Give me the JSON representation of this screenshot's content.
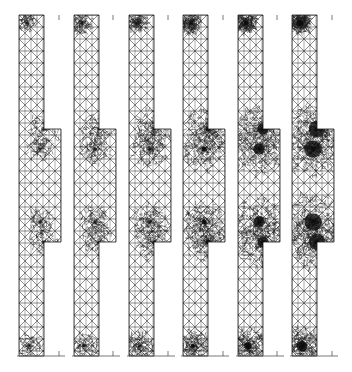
{
  "figure": {
    "panel_count": 6,
    "colors": {
      "background": "#ffffff",
      "mesh_line": "#1a1a1a",
      "dense_fill": "#0a0a0a"
    },
    "geometry": {
      "strip_top": 15,
      "strip_bottom": 356,
      "wide_top": 129,
      "wide_bottom": 242,
      "strip_width": 25,
      "wide_extra": 17,
      "baseline_length": 46
    },
    "panels": [
      {
        "id": 1,
        "x": 19,
        "tick_x": 59,
        "refinement": 0.15
      },
      {
        "id": 2,
        "x": 74,
        "tick_x": 113,
        "refinement": 0.25
      },
      {
        "id": 3,
        "x": 129,
        "tick_x": 168,
        "refinement": 0.4
      },
      {
        "id": 4,
        "x": 183,
        "tick_x": 223,
        "refinement": 0.6
      },
      {
        "id": 5,
        "x": 238,
        "tick_x": 277,
        "refinement": 0.8
      },
      {
        "id": 6,
        "x": 292,
        "tick_x": 332,
        "refinement": 0.95
      }
    ]
  }
}
